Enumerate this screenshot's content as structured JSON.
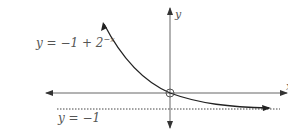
{
  "figure": {
    "type": "function-graph",
    "curve_label": {
      "prefix": "y = −1 + 2",
      "exponent": "−x"
    },
    "asymptote_label": "y = −1",
    "axes": {
      "x_label": "x",
      "y_label": "y"
    },
    "function": "y = -1 + 2^(-x)",
    "asymptote": "y = -1",
    "marked_point": {
      "x": 0,
      "y": 0,
      "style": "open-circle"
    },
    "colors": {
      "axis": "#555555",
      "curve": "#222222",
      "asymptote": "#444444",
      "label": "#555555"
    }
  }
}
